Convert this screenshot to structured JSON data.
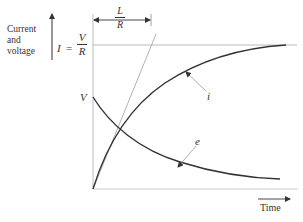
{
  "diagram": {
    "y_axis_label": [
      "Current",
      "and",
      "voltage"
    ],
    "asymptote_label": {
      "lhs": "I",
      "equals": "=",
      "num": "V",
      "den": "R"
    },
    "time_constant_label": {
      "num": "L",
      "den": "R"
    },
    "v_label": "V",
    "current_curve_label": "i",
    "voltage_curve_label": "e",
    "x_axis_label": "Time",
    "colors": {
      "ink": "#333333",
      "light_line": "#bbbbbb",
      "background": "#ffffff"
    }
  }
}
